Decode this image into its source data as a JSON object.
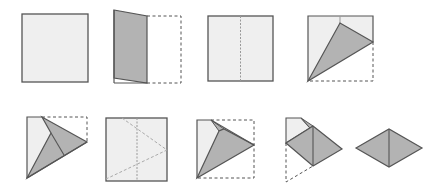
{
  "colors": {
    "paper_light": "#efefef",
    "paper_shaded": "#b3b3b3",
    "edge": "#555555",
    "dash": "#555555",
    "crease": "#9a9a9a",
    "background": "#ffffff"
  },
  "steps": [
    {
      "index": 1,
      "description": "Square sheet of paper"
    },
    {
      "index": 2,
      "description": "Fold the left side over to the center"
    },
    {
      "index": 3,
      "description": "Unfold showing vertical center crease"
    },
    {
      "index": 4,
      "description": "Fold the corner to the center crease forming a shaded triangle"
    },
    {
      "index": 5,
      "description": "Fold the opposite flap forming a kite shape"
    },
    {
      "index": 6,
      "description": "Unfold showing crease pattern"
    },
    {
      "index": 7,
      "description": "Refold along the creases"
    },
    {
      "index": 8,
      "description": "Fold the top flap down"
    },
    {
      "index": 9,
      "description": "Finished diamond shape"
    }
  ]
}
